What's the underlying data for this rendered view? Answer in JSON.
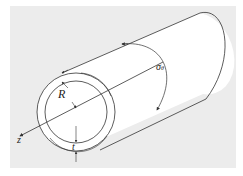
{
  "diagram": {
    "type": "thin-walled cylinder",
    "labels": {
      "radius": "R",
      "thickness": "t",
      "axis": "z",
      "stress": "σ",
      "stress_subscript": "θ"
    },
    "colors": {
      "background_panel": "#ececec",
      "tube_fill": "#ffffff",
      "stroke": "#333333"
    }
  }
}
